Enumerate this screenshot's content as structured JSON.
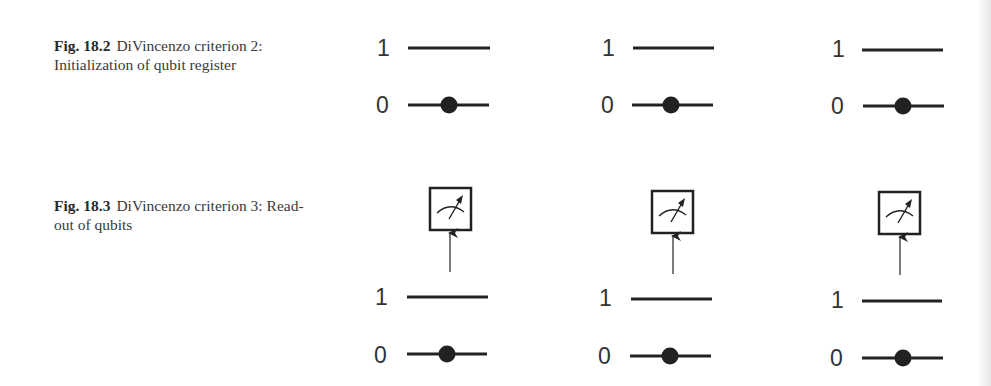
{
  "figures": [
    {
      "id": "fig-18-2",
      "label": "Fig. 18.2",
      "caption": "DiVincenzo criterion 2: Initialization of qubit register",
      "registers": [
        {
          "levels": [
            {
              "label": "1",
              "occupied": false
            },
            {
              "label": "0",
              "occupied": true
            }
          ],
          "measurement": false
        },
        {
          "levels": [
            {
              "label": "1",
              "occupied": false
            },
            {
              "label": "0",
              "occupied": true
            }
          ],
          "measurement": false
        },
        {
          "levels": [
            {
              "label": "1",
              "occupied": false
            },
            {
              "label": "0",
              "occupied": true
            }
          ],
          "measurement": false
        }
      ]
    },
    {
      "id": "fig-18-3",
      "label": "Fig. 18.3",
      "caption": "DiVincenzo criterion 3: Read-out of qubits",
      "registers": [
        {
          "levels": [
            {
              "label": "1",
              "occupied": false
            },
            {
              "label": "0",
              "occupied": true
            }
          ],
          "measurement": true,
          "icon": "meter-icon"
        },
        {
          "levels": [
            {
              "label": "1",
              "occupied": false
            },
            {
              "label": "0",
              "occupied": true
            }
          ],
          "measurement": true,
          "icon": "meter-icon"
        },
        {
          "levels": [
            {
              "label": "1",
              "occupied": false
            },
            {
              "label": "0",
              "occupied": true
            }
          ],
          "measurement": true,
          "icon": "meter-icon"
        }
      ]
    }
  ],
  "colors": {
    "ink": "#222222",
    "text": "#333333"
  }
}
